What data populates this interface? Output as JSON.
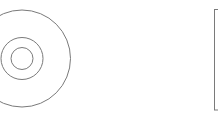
{
  "diagram": {
    "stroke_color": "#7a7a7a",
    "background": "#ffffff",
    "disc": {
      "label": "disc-shape",
      "center": [
        22,
        58.5
      ],
      "rings": [
        {
          "name": "outer-ring",
          "radius": 48.5
        },
        {
          "name": "middle-ring",
          "radius": 21
        },
        {
          "name": "inner-ring",
          "radius": 11
        }
      ]
    },
    "box": {
      "label": "rectangle-shape",
      "x": 214.5,
      "y": 9.5,
      "width": 20,
      "height": 100.5
    }
  }
}
